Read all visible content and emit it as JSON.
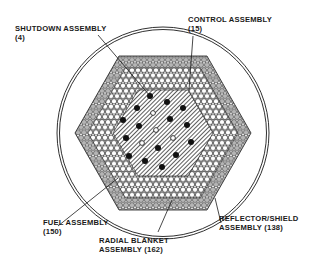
{
  "diagram": {
    "colors": {
      "line": "#1a1a1a",
      "reflector_fill": "#b8b8b8",
      "blanket_fill": "#ffffff",
      "fuel_hatch": "#333333",
      "control_fill": "#111111",
      "shutdown_fill": "#ffffff"
    },
    "labels": {
      "shutdown": {
        "name": "SHUTDOWN ASSEMBLY",
        "count": "(4)"
      },
      "control": {
        "name": "CONTROL ASSEMBLY",
        "count": "(15)"
      },
      "fuel": {
        "name": "FUEL ASSEMBLY",
        "count": "(150)"
      },
      "radial_blanket": {
        "name": "RADIAL BLANKET",
        "count": "ASSEMBLY (162)"
      },
      "reflector": {
        "name": "REFLECTOR/SHIELD",
        "count": "ASSEMBLY (138)"
      }
    }
  }
}
